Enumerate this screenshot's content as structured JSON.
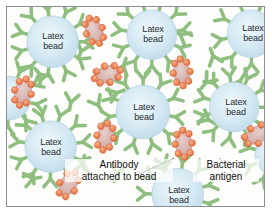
{
  "figure": {
    "background_color": "#fdfdfc",
    "frame_color": "#8b8f93"
  },
  "colors": {
    "bead_fill": "#cfe4ef",
    "bead_fill_center": "#e2f0f7",
    "bead_edge": "#b4d4e4",
    "antibody": "#8fbf7f",
    "antibody_dark": "#6ea55c",
    "antigen_body": "#d8b7b4",
    "antigen_edge": "#c49b98",
    "antigen_dot": "#ef8a5a",
    "antigen_dot_edge": "#d9643a",
    "leader_line": "#1b1b1b",
    "text": "#1b1b1b"
  },
  "legend": {
    "antibody_label_line1": "Antibody",
    "antibody_label_line2": "attached to bead",
    "antigen_label_line1": "Bacterial",
    "antigen_label_line2": "antigen"
  },
  "bead_label": {
    "line1": "Latex",
    "line2": "bead"
  },
  "beads": [
    {
      "id": "bead-top-left",
      "cx": 46,
      "cy": 35,
      "r": 26,
      "label_visible": true
    },
    {
      "id": "bead-top-center",
      "cx": 146,
      "cy": 28,
      "r": 25,
      "label_visible": true
    },
    {
      "id": "bead-top-right",
      "cx": 246,
      "cy": 27,
      "r": 24,
      "label_visible": true
    },
    {
      "id": "bead-mid-center",
      "cx": 137,
      "cy": 106,
      "r": 27,
      "label_visible": true
    },
    {
      "id": "bead-mid-right",
      "cx": 229,
      "cy": 101,
      "r": 25,
      "label_visible": true
    },
    {
      "id": "bead-lower-left",
      "cx": 44,
      "cy": 141,
      "r": 26,
      "label_visible": true
    },
    {
      "id": "bead-bottom-center",
      "cx": 172,
      "cy": 189,
      "r": 26,
      "label_visible": true
    },
    {
      "id": "bead-left-edge",
      "cx": 2,
      "cy": 92,
      "r": 22,
      "label_visible": false
    },
    {
      "id": "bead-right-edge",
      "cx": 270,
      "cy": 150,
      "r": 20,
      "label_visible": false
    }
  ],
  "antigens": [
    {
      "id": "antigen-top-left",
      "cx": 88,
      "cy": 24,
      "angle": -22,
      "dots": 8
    },
    {
      "id": "antigen-upper-mid",
      "cx": 101,
      "cy": 68,
      "angle": 72,
      "dots": 8
    },
    {
      "id": "antigen-left-edge",
      "cx": 16,
      "cy": 86,
      "angle": 14,
      "dots": 8
    },
    {
      "id": "antigen-center-right",
      "cx": 176,
      "cy": 66,
      "angle": -6,
      "dots": 8
    },
    {
      "id": "antigen-mid-left",
      "cx": 99,
      "cy": 131,
      "angle": 10,
      "dots": 8
    },
    {
      "id": "antigen-lower-right",
      "cx": 178,
      "cy": 138,
      "angle": -4,
      "dots": 8
    },
    {
      "id": "antigen-bottom-left",
      "cx": 62,
      "cy": 179,
      "angle": 30,
      "dots": 7
    },
    {
      "id": "antigen-right-edge",
      "cx": 252,
      "cy": 129,
      "angle": 62,
      "dots": 7
    }
  ],
  "leader_lines": [
    {
      "id": "antibody-leader",
      "x1": 128,
      "y1": 171,
      "x2": 168,
      "y2": 153
    },
    {
      "id": "antigen-leader",
      "x1": 231,
      "y1": 170,
      "x2": 214,
      "y2": 153
    }
  ],
  "chart_data": {
    "type": "diagram",
    "elements": [
      {
        "name": "Latex bead",
        "count": 9,
        "color": "#cfe4ef",
        "shape": "circle"
      },
      {
        "name": "Antibody attached to bead",
        "count": 40,
        "color": "#8fbf7f",
        "shape": "Y"
      },
      {
        "name": "Bacterial antigen",
        "count": 8,
        "color": "#d8b7b4",
        "shape": "studded-oval"
      }
    ]
  }
}
